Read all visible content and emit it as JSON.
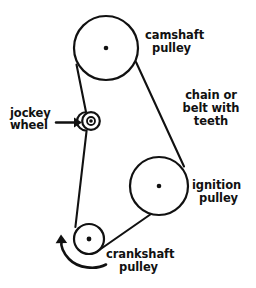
{
  "diagram": {
    "background_color": "#ffffff",
    "ink_color": "#111111",
    "labels": {
      "camshaft_line1": "camshaft",
      "camshaft_line2": "pulley",
      "belt_line1": "chain or",
      "belt_line2": "belt with",
      "belt_line3": "teeth",
      "jockey_line1": "jockey",
      "jockey_line2": "wheel",
      "ignition_line1": "ignition",
      "ignition_line2": "pulley",
      "crankshaft_line1": "crankshaft",
      "crankshaft_line2": "pulley"
    },
    "components": [
      {
        "name": "camshaft-pulley",
        "label": "camshaft pulley",
        "shape": "circle",
        "cx": 106,
        "cy": 48,
        "r": 32,
        "hub_r": 2.2
      },
      {
        "name": "jockey-wheel",
        "label": "jockey wheel",
        "shape": "circle",
        "cx": 91,
        "cy": 121,
        "r": 9,
        "inner_r": 4.2,
        "hub_r": 1.8
      },
      {
        "name": "ignition-pulley",
        "label": "ignition pulley",
        "shape": "circle",
        "cx": 159,
        "cy": 186,
        "r": 29,
        "hub_r": 2.2
      },
      {
        "name": "crankshaft-pulley",
        "label": "crankshaft pulley",
        "shape": "circle",
        "cx": 89,
        "cy": 239,
        "r": 15,
        "hub_r": 2.2
      }
    ],
    "annotations": {
      "pointer_arrow": {
        "name": "jockey-wheel-pointer-arrow",
        "from_x": 56,
        "from_y": 123,
        "to_x": 80,
        "to_y": 123,
        "direction": "right"
      },
      "rotation_arrow": {
        "name": "crankshaft-rotation-arrow",
        "direction": "counterclockwise",
        "tip_x": 62,
        "tip_y": 236
      }
    },
    "belt": {
      "name": "toothed-belt-path",
      "description": "chain or belt with teeth wrapping camshaft, jockey wheel, crankshaft and ignition pulleys"
    }
  }
}
